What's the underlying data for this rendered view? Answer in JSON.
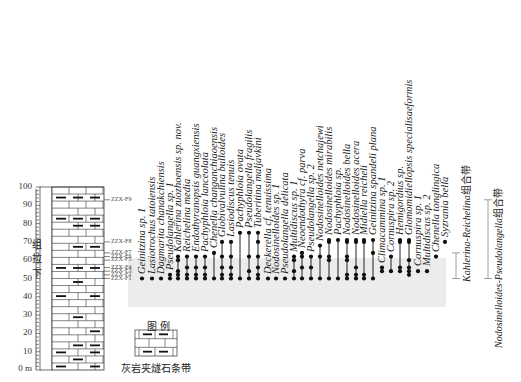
{
  "axis": {
    "unit_label": "0 m",
    "ticks": [
      "10",
      "20",
      "30",
      "40",
      "50",
      "60",
      "70",
      "80",
      "90",
      "100"
    ]
  },
  "formation": {
    "chars": [
      "下",
      "拉",
      "组"
    ]
  },
  "samples": [
    "ZZX-F1",
    "ZZX-F2",
    "ZZX-F3",
    "ZZX-F4",
    "ZZX-F5",
    "ZZX-F6",
    "ZZX-F7",
    "ZZX-F8",
    "ZZX-F9"
  ],
  "legend": {
    "title": "图例",
    "caption": "灰岩夹燧石条带"
  },
  "taxa": [
    {
      "name": "Geinitzina sp. 1"
    },
    {
      "name": "Lasiotrochus tatoiensis"
    },
    {
      "name": "Dagmarita chanakchiensis"
    },
    {
      "name": "Pseudolangella sp. 1"
    },
    {
      "name": "Kahlerina zuozhoensis sp. nov."
    },
    {
      "name": "Reichelina media"
    },
    {
      "name": "Endothyranopsis guangxiensis"
    },
    {
      "name": "Pachyphloia lanceolata"
    },
    {
      "name": "Chenella changanchiaoensis"
    },
    {
      "name": "Globivalvulina bulloides"
    },
    {
      "name": "Lasiodiscus tenuis"
    },
    {
      "name": "Pachyphloia ovata"
    },
    {
      "name": "Pseudolangella fragilis"
    },
    {
      "name": "Tuberitina maljavkini"
    },
    {
      "name": "Deckerella cf. tenuissima"
    },
    {
      "name": "Nodosinelloides sp. 1"
    },
    {
      "name": "Pseudolangella delicata"
    },
    {
      "name": "Multidiscus sp. 1"
    },
    {
      "name": "Neoendothyra cf. parva"
    },
    {
      "name": "Pseudolangella sp. 2"
    },
    {
      "name": "Nodosinelloides netchajewi"
    },
    {
      "name": "Nodosinelloides mirabilis"
    },
    {
      "name": "Pachyphloia sp."
    },
    {
      "name": "Nodosinelloides bella"
    },
    {
      "name": "Nodosinelloides acera"
    },
    {
      "name": "Midiella reicheli"
    },
    {
      "name": "Geinitzina spandeli plana"
    },
    {
      "name": "Climacammina sp. 1"
    },
    {
      "name": "Cornuspira sp. 2"
    },
    {
      "name": "Hemigordius sp."
    },
    {
      "name": "Glomomidiellopsis specialisaeformis"
    },
    {
      "name": "Cornuspira sp. 1"
    },
    {
      "name": "Multidiscus sp. 2"
    },
    {
      "name": "Chenella tonglingica"
    },
    {
      "name": "Syzrania bella"
    }
  ],
  "zones": [
    {
      "italic": "Kahlerina-Reichelina",
      "suffix": "组合带"
    },
    {
      "italic": "Nodosinelloides-Pseudolangella",
      "suffix": "组合带"
    }
  ],
  "colors": {
    "zone_shade": "#e6e6e6",
    "line": "#222222"
  }
}
